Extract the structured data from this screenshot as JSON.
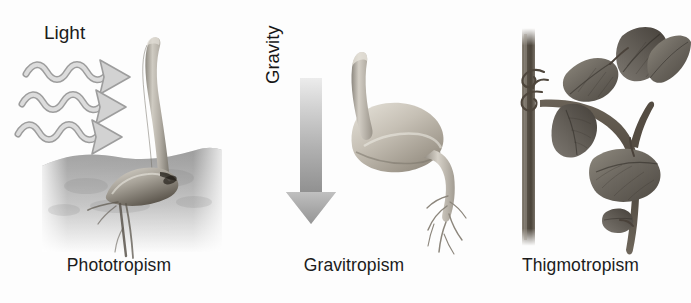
{
  "figure": {
    "background_color": "#ffffff",
    "ink_color": "#1b1b1b"
  },
  "panels": [
    {
      "id": "phototropism",
      "caption": "Phototropism",
      "stimulus_label": "Light",
      "stimulus_direction": "down-right",
      "stimulus_icon": "wavy-light-arrows",
      "arrow_count": 3,
      "subject": "seedling with curved shoot bending toward light",
      "has_soil": true,
      "soil_color_top": "#9a9a9a",
      "soil_color_bottom": "#efefef",
      "plant_color": "#b9b5ad",
      "arrow_fill": "#d2d2d2",
      "arrow_stroke": "#9d9d9d"
    },
    {
      "id": "gravitropism",
      "caption": "Gravitropism",
      "stimulus_label": "Gravity",
      "stimulus_direction": "down",
      "stimulus_icon": "down-arrow",
      "arrow_count": 1,
      "subject": "germinating seed with shoot curving up and root growing down",
      "has_soil": false,
      "arrow_gradient_from": "#e4e4e4",
      "arrow_gradient_to": "#8e8e8e",
      "plant_color": "#c3bdb2"
    },
    {
      "id": "thigmotropism",
      "caption": "Thigmotropism",
      "stimulus_label": "",
      "stimulus_direction": "contact",
      "stimulus_icon": "support-pole",
      "arrow_count": 0,
      "subject": "vine with leaves and tendril coiling around a vertical pole",
      "has_soil": false,
      "pole_color": "#5d564c",
      "stem_color": "#4e463c",
      "leaf_color": "#6f6a60"
    }
  ]
}
